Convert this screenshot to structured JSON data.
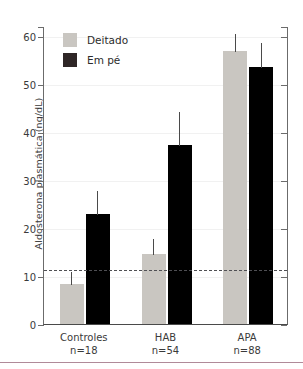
{
  "chart_data": {
    "type": "bar",
    "title": "",
    "xlabel": "",
    "ylabel": "Aldosterona plasmática (ng/dL)",
    "ylim": [
      0,
      62
    ],
    "yticks": [
      0,
      10,
      20,
      30,
      40,
      50,
      60
    ],
    "ytick_labels": [
      "0",
      "10",
      "20",
      "30",
      "40",
      "50",
      "60"
    ],
    "grid": true,
    "legend_position": "top-left",
    "categories": [
      "Controles",
      "HAB",
      "APA"
    ],
    "category_sublabels": [
      "n=18",
      "n=54",
      "n=88"
    ],
    "series": [
      {
        "name": "Deitado",
        "color": "#c9c6c1",
        "values": [
          8.3,
          14.6,
          56.7
        ],
        "errors_upper": [
          11.0,
          17.8,
          60.5
        ]
      },
      {
        "name": "Em pé",
        "color": "#000000",
        "values": [
          22.8,
          37.3,
          53.5
        ],
        "errors_upper": [
          27.8,
          44.3,
          58.7
        ]
      }
    ],
    "reference_line": {
      "value": 11.5,
      "style": "dashed",
      "color": "#4f4f53"
    },
    "annotations": []
  },
  "legend": {
    "items": [
      {
        "label": "Deitado",
        "color": "#c9c6c1"
      },
      {
        "label": "Em pé",
        "color": "#2e2626"
      }
    ]
  },
  "colors": {
    "axis": "#6b6b6b",
    "grid": "#f1f1f1",
    "text": "#3a3a3a",
    "bottom_rule": "#b08a99"
  }
}
